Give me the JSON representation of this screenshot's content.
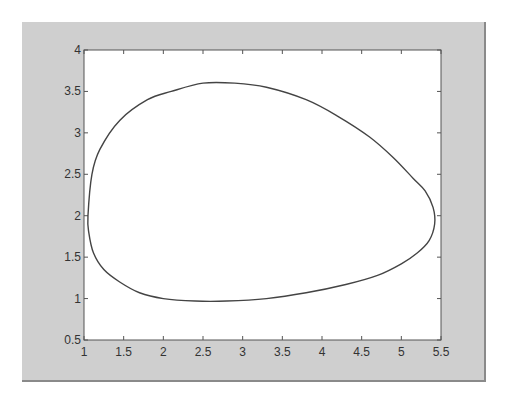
{
  "chart_data": {
    "type": "line",
    "title": "",
    "xlabel": "",
    "ylabel": "",
    "xlim": [
      1,
      5.5
    ],
    "ylim": [
      0.5,
      4
    ],
    "grid": false,
    "legend": null,
    "x_ticks": [
      "1",
      "1.5",
      "2",
      "2.5",
      "3",
      "3.5",
      "4",
      "4.5",
      "5",
      "5.5"
    ],
    "y_ticks": [
      "0.5",
      "1",
      "1.5",
      "2",
      "2.5",
      "3",
      "3.5",
      "4"
    ],
    "series": [
      {
        "name": "closed orbit",
        "color": "#444444",
        "x": [
          1.05,
          1.1,
          1.2,
          1.45,
          1.8,
          2.1,
          2.5,
          2.9,
          3.3,
          3.8,
          4.2,
          4.6,
          4.9,
          5.15,
          5.3,
          5.4,
          5.42,
          5.35,
          5.2,
          5.0,
          4.7,
          4.3,
          3.8,
          3.3,
          2.8,
          2.4,
          2.0,
          1.7,
          1.45,
          1.25,
          1.12,
          1.06,
          1.05
        ],
        "y": [
          2.0,
          2.5,
          2.8,
          3.15,
          3.4,
          3.5,
          3.6,
          3.6,
          3.55,
          3.4,
          3.2,
          2.95,
          2.7,
          2.45,
          2.3,
          2.1,
          1.9,
          1.7,
          1.55,
          1.42,
          1.28,
          1.17,
          1.07,
          1.0,
          0.97,
          0.97,
          1.0,
          1.07,
          1.2,
          1.35,
          1.55,
          1.8,
          2.0
        ]
      }
    ]
  },
  "colors": {
    "figure_bg": "#cfcfcf",
    "axes_bg": "#ffffff",
    "line": "#444444"
  }
}
